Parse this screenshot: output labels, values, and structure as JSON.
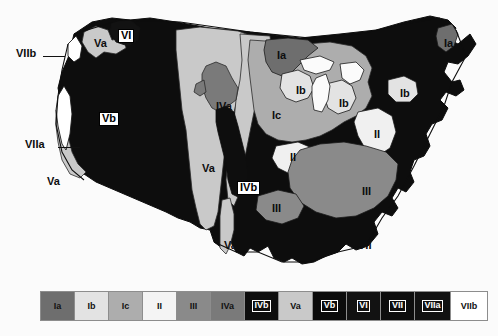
{
  "figure": {
    "type": "map",
    "projection_note": "contiguous United States outline"
  },
  "colors": {
    "background": "#fbfbfb",
    "outline": "#101010",
    "Ia": "#6e6e6e",
    "Ib": "#e3e3e3",
    "Ic": "#adadad",
    "II": "#f0f0f0",
    "III": "#8a8a8a",
    "IVa": "#7a7a7a",
    "IVb": "#0e0e0e",
    "Va": "#c9c9c9",
    "Vb": "#0b0b0b",
    "VI": "#121212",
    "VII": "#0d0d0d",
    "VIIa": "#111111",
    "VIIb": "#ffffff"
  },
  "legend": {
    "name": "zone-legend",
    "items": [
      {
        "label": "Ia",
        "color": "#6e6e6e",
        "text_color": "#111111",
        "boxed": false,
        "width": 34
      },
      {
        "label": "Ib",
        "color": "#e3e3e3",
        "text_color": "#111111",
        "boxed": false,
        "width": 34
      },
      {
        "label": "Ic",
        "color": "#adadad",
        "text_color": "#111111",
        "boxed": false,
        "width": 34
      },
      {
        "label": "II",
        "color": "#f4f4f4",
        "text_color": "#111111",
        "boxed": false,
        "width": 34
      },
      {
        "label": "III",
        "color": "#8a8a8a",
        "text_color": "#111111",
        "boxed": false,
        "width": 34
      },
      {
        "label": "IVa",
        "color": "#7a7a7a",
        "text_color": "#111111",
        "boxed": false,
        "width": 34
      },
      {
        "label": "IVb",
        "color": "#0e0e0e",
        "text_color": "#ffffff",
        "boxed": true,
        "width": 34
      },
      {
        "label": "Va",
        "color": "#c9c9c9",
        "text_color": "#111111",
        "boxed": false,
        "width": 34
      },
      {
        "label": "Vb",
        "color": "#0b0b0b",
        "text_color": "#ffffff",
        "boxed": true,
        "width": 34
      },
      {
        "label": "VI",
        "color": "#121212",
        "text_color": "#ffffff",
        "boxed": true,
        "width": 34
      },
      {
        "label": "VII",
        "color": "#0d0d0d",
        "text_color": "#ffffff",
        "boxed": true,
        "width": 34
      },
      {
        "label": "VIIa",
        "color": "#111111",
        "text_color": "#ffffff",
        "boxed": true,
        "width": 36
      },
      {
        "label": "VIIb",
        "color": "#ffffff",
        "text_color": "#111111",
        "boxed": false,
        "width": 36
      }
    ]
  },
  "map_labels": [
    {
      "id": "label-viib",
      "text": "VIIb",
      "x": 16,
      "y": 48,
      "style": "dark",
      "leader": {
        "x": 43,
        "y": 56,
        "w": 22
      }
    },
    {
      "id": "label-va-nw",
      "text": "Va",
      "x": 94,
      "y": 38,
      "style": "dark",
      "leader": null
    },
    {
      "id": "label-vi",
      "text": "VI",
      "x": 118,
      "y": 29,
      "style": "boxed",
      "leader": null
    },
    {
      "id": "label-ia-n",
      "text": "Ia",
      "x": 277,
      "y": 50,
      "style": "dark",
      "leader": null
    },
    {
      "id": "label-ib-n",
      "text": "Ib",
      "x": 296,
      "y": 85,
      "style": "dark",
      "leader": null
    },
    {
      "id": "label-ib-lk",
      "text": "Ib",
      "x": 339,
      "y": 98,
      "style": "dark",
      "leader": null
    },
    {
      "id": "label-ia-ne",
      "text": "Ia",
      "x": 444,
      "y": 38,
      "style": "dark",
      "leader": null
    },
    {
      "id": "label-ib-ne",
      "text": "Ib",
      "x": 400,
      "y": 88,
      "style": "dark",
      "leader": null
    },
    {
      "id": "label-vb",
      "text": "Vb",
      "x": 99,
      "y": 112,
      "style": "boxed",
      "leader": null
    },
    {
      "id": "label-iva",
      "text": "IVa",
      "x": 216,
      "y": 101,
      "style": "dark",
      "leader": null
    },
    {
      "id": "label-ic",
      "text": "Ic",
      "x": 272,
      "y": 110,
      "style": "dark",
      "leader": null
    },
    {
      "id": "label-ii-ne",
      "text": "II",
      "x": 374,
      "y": 129,
      "style": "dark",
      "leader": null
    },
    {
      "id": "label-viia",
      "text": "VIIa",
      "x": 25,
      "y": 139,
      "style": "dark",
      "leader": {
        "x": 58,
        "y": 147,
        "w": 22
      }
    },
    {
      "id": "label-va-w",
      "text": "Va",
      "x": 202,
      "y": 163,
      "style": "dark",
      "leader": null
    },
    {
      "id": "label-ii-s",
      "text": "II",
      "x": 290,
      "y": 152,
      "style": "dark",
      "leader": null
    },
    {
      "id": "label-va-sw",
      "text": "Va",
      "x": 47,
      "y": 176,
      "style": "dark",
      "leader": null
    },
    {
      "id": "label-ivb",
      "text": "IVb",
      "x": 237,
      "y": 181,
      "style": "boxed",
      "leader": null
    },
    {
      "id": "label-iii-e",
      "text": "III",
      "x": 362,
      "y": 186,
      "style": "dark",
      "leader": null
    },
    {
      "id": "label-iii-s",
      "text": "III",
      "x": 272,
      "y": 203,
      "style": "dark",
      "leader": null
    },
    {
      "id": "label-va-tx",
      "text": "Va",
      "x": 224,
      "y": 240,
      "style": "dark",
      "leader": null
    },
    {
      "id": "label-vii",
      "text": "VII",
      "x": 358,
      "y": 240,
      "style": "dark",
      "leader": null
    }
  ]
}
